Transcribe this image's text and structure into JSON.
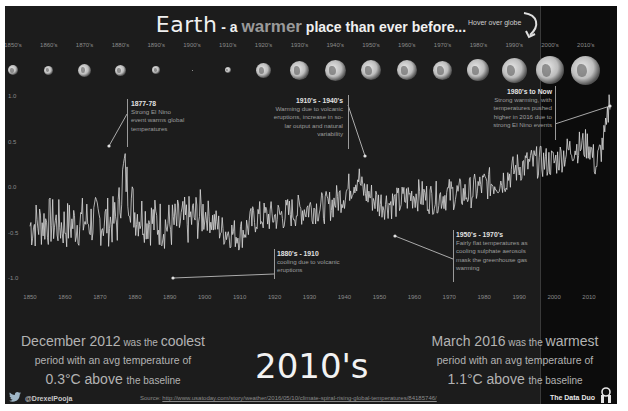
{
  "header": {
    "title_earth": "Earth",
    "title_dash": " - a ",
    "title_warmer": "warmer",
    "title_rest": " place than ever before...",
    "hover_hint": "Hover over globe"
  },
  "decades": [
    {
      "label": "1850's",
      "globe_size": 10
    },
    {
      "label": "1860's",
      "globe_size": 9
    },
    {
      "label": "1870's",
      "globe_size": 13
    },
    {
      "label": "1880's",
      "globe_size": 11
    },
    {
      "label": "1890's",
      "globe_size": 8
    },
    {
      "label": "1900's",
      "globe_size": 1
    },
    {
      "label": "1910's",
      "globe_size": 6
    },
    {
      "label": "1920's",
      "globe_size": 15
    },
    {
      "label": "1930's",
      "globe_size": 19
    },
    {
      "label": "1940's",
      "globe_size": 21
    },
    {
      "label": "1950's",
      "globe_size": 20
    },
    {
      "label": "1960's",
      "globe_size": 20
    },
    {
      "label": "1970's",
      "globe_size": 19
    },
    {
      "label": "1980's",
      "globe_size": 22
    },
    {
      "label": "1990's",
      "globe_size": 25
    },
    {
      "label": "2000's",
      "globe_size": 28
    },
    {
      "label": "2010's",
      "globe_size": 29
    }
  ],
  "annotations": [
    {
      "head": "1877-78",
      "lines": [
        "Strong El Nino",
        "event warms global",
        "temperatures"
      ]
    },
    {
      "head": "1910's - 1940's",
      "lines": [
        "Warming due to volcanic",
        "eruptions, increase in so-",
        "lar output and natural",
        "variability"
      ]
    },
    {
      "head": "1980's to Now",
      "lines": [
        "Strong warming, with",
        "temperatures pushed",
        "higher in 2016 due to",
        "strong El Nino events"
      ]
    },
    {
      "head": "1880's - 1910",
      "lines": [
        "cooling due to volcanic",
        "eruptions"
      ]
    },
    {
      "head": "1950's - 1970's",
      "lines": [
        "Fairly flat temperatures as",
        "cooling sulphate aerosols",
        "mask the greenhouse gas",
        "warming"
      ]
    }
  ],
  "stats": {
    "coolest": {
      "date": "December 2012",
      "was_the": " was the ",
      "word": "coolest",
      "line2": "period with an avg temperature of",
      "value": "0.3°C",
      "above": " above ",
      "baseline": "the baseline"
    },
    "warmest": {
      "date": "March 2016",
      "was_the": " was the ",
      "word": "warmest",
      "line2": "period with an avg temperature of",
      "value": "1.1°C",
      "above": " above ",
      "baseline": "the baseline"
    },
    "selected_decade": "2010's"
  },
  "footer": {
    "handle": "@DrexelPooja",
    "source_label": "Source: ",
    "source_url": "http://www.usatoday.com/story/weather/2016/05/10/climate-spiral-rising-global-temperatures/84185746/",
    "brand": "The Data Duo"
  },
  "colors": {
    "background": "#1c1c1c",
    "highlight_background": "#0c0c0c",
    "line": "#d9d9d9",
    "title": "#f0f0f0",
    "warmer_word": "#9a9a9a"
  },
  "chart_data": {
    "type": "line",
    "title": "Earth - a warmer place than ever before...",
    "xlabel": "",
    "ylabel": "Temperature anomaly (°C)",
    "x_ticks": [
      1850,
      1860,
      1870,
      1880,
      1890,
      1900,
      1910,
      1920,
      1930,
      1940,
      1950,
      1960,
      1970,
      1980,
      1990,
      2000,
      2010
    ],
    "y_ticks": [
      "1.0",
      "0.5",
      "0.0",
      "-0.5",
      "-1.0"
    ],
    "ylim": [
      -1.0,
      1.2
    ],
    "xlim": [
      1850,
      2016
    ],
    "grid": false,
    "highlight_region": [
      1993,
      2016
    ],
    "series": [
      {
        "name": "Monthly global temperature anomaly",
        "x": [
          1850,
          1855,
          1860,
          1865,
          1870,
          1875,
          1877,
          1878,
          1880,
          1885,
          1890,
          1895,
          1900,
          1905,
          1910,
          1915,
          1920,
          1925,
          1930,
          1935,
          1940,
          1944,
          1945,
          1950,
          1955,
          1960,
          1965,
          1970,
          1975,
          1980,
          1985,
          1990,
          1995,
          2000,
          2005,
          2010,
          2012,
          2015,
          2016
        ],
        "values": [
          -0.35,
          -0.3,
          -0.35,
          -0.3,
          -0.3,
          -0.3,
          0.3,
          0.05,
          -0.2,
          -0.3,
          -0.35,
          -0.3,
          -0.2,
          -0.4,
          -0.45,
          -0.25,
          -0.25,
          -0.2,
          -0.15,
          -0.15,
          0.0,
          0.2,
          0.05,
          -0.1,
          -0.1,
          0.0,
          -0.05,
          0.0,
          0.0,
          0.1,
          0.15,
          0.3,
          0.35,
          0.35,
          0.5,
          0.55,
          0.3,
          0.7,
          1.1
        ]
      }
    ],
    "annotations": [
      {
        "x": 1877,
        "text": "1877-78 Strong El Nino event warms global temperatures"
      },
      {
        "x": 1944,
        "text": "1910's - 1940's Warming due to volcanic eruptions, increase in solar output and natural variability"
      },
      {
        "x": 2016,
        "text": "1980's to Now Strong warming, with temperatures pushed higher in 2016 due to strong El Nino events"
      },
      {
        "x": 1893,
        "text": "1880's - 1910 cooling due to volcanic eruptions"
      },
      {
        "x": 1950,
        "text": "1950's - 1970's Fairly flat temperatures as cooling sulphate aerosols mask the greenhouse gas warming"
      }
    ]
  }
}
